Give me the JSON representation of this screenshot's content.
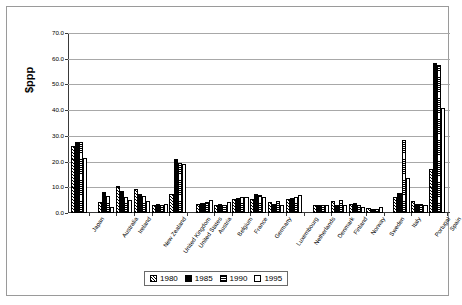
{
  "chart_data": {
    "type": "bar",
    "title": "",
    "xlabel": "",
    "ylabel": "$ppp",
    "ylim": [
      0,
      70
    ],
    "ytick_labels": [
      "0.0",
      "10.0",
      "20.0",
      "30.0",
      "40.0",
      "50.0",
      "60.0",
      "70.0"
    ],
    "ytick_values": [
      0,
      10,
      20,
      30,
      40,
      50,
      60,
      70
    ],
    "grid": true,
    "legend_position": "bottom-center",
    "categories": [
      "Japan",
      "Australia",
      "Ireland",
      "New Zealand",
      "United Kingdom",
      "United States",
      "Austria",
      "Belgium",
      "France",
      "Germany",
      "Luxembourg",
      "Netherlands",
      "Denmark",
      "Finland",
      "Norway",
      "Sweden",
      "Italy",
      "Portugal",
      "Spain"
    ],
    "group_breaks_after": [
      "Japan",
      "United States",
      "Netherlands",
      "Sweden"
    ],
    "series": [
      {
        "name": "1980",
        "values": [
          26.0,
          4.3,
          10.4,
          9.3,
          3.0,
          7.3,
          3.5,
          3.0,
          5.5,
          5.5,
          4.4,
          5.4,
          3.3,
          4.5,
          3.4,
          1.8,
          6.3,
          4.8,
          17.0
        ]
      },
      {
        "name": "1985",
        "values": [
          27.5,
          8.0,
          8.5,
          7.3,
          3.4,
          21.0,
          4.0,
          3.5,
          6.0,
          7.5,
          3.7,
          6.0,
          3.3,
          3.3,
          3.8,
          1.6,
          7.7,
          3.7,
          58.5
        ]
      },
      {
        "name": "1990",
        "values": [
          27.5,
          6.5,
          6.4,
          6.7,
          3.3,
          19.5,
          4.3,
          3.3,
          6.2,
          7.0,
          4.6,
          6.4,
          3.2,
          5.2,
          3.3,
          1.7,
          28.5,
          3.5,
          57.5
        ]
      },
      {
        "name": "1995",
        "values": [
          21.5,
          2.3,
          5.2,
          4.5,
          3.4,
          19.0,
          5.2,
          4.2,
          6.4,
          6.3,
          3.3,
          7.2,
          3.3,
          3.3,
          2.5,
          2.4,
          13.5,
          3.3,
          41.0
        ]
      }
    ],
    "legend_entries": [
      {
        "label": "1980",
        "pattern": "diagonal-hatch"
      },
      {
        "label": "1985",
        "pattern": "solid-black"
      },
      {
        "label": "1990",
        "pattern": "horizontal-grid"
      },
      {
        "label": "1995",
        "pattern": "white"
      }
    ]
  }
}
